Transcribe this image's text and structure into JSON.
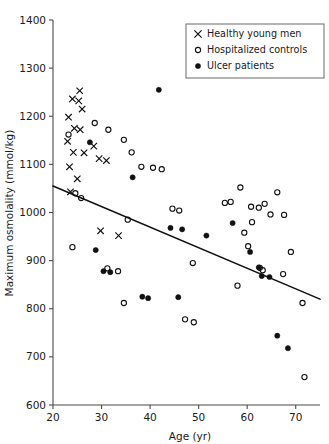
{
  "chart_data": {
    "type": "scatter",
    "title": "",
    "xlabel": "Age (yr)",
    "ylabel": "Maximum osmolality (mmol/kg)",
    "xlim": [
      20,
      75
    ],
    "ylim": [
      600,
      1400
    ],
    "xticks": [
      20,
      30,
      40,
      50,
      60,
      70
    ],
    "yticks": [
      600,
      700,
      800,
      900,
      1000,
      1100,
      1200,
      1300,
      1400
    ],
    "grid": false,
    "legend_position": "top-right",
    "series": [
      {
        "name": "Healthy young men",
        "marker": "cross",
        "points": [
          [
            25.5,
            1253
          ],
          [
            24.0,
            1236
          ],
          [
            25.3,
            1232
          ],
          [
            26.0,
            1215
          ],
          [
            23.2,
            1198
          ],
          [
            24.4,
            1175
          ],
          [
            25.6,
            1172
          ],
          [
            23.0,
            1148
          ],
          [
            24.2,
            1125
          ],
          [
            26.4,
            1124
          ],
          [
            23.4,
            1095
          ],
          [
            25.0,
            1070
          ],
          [
            23.6,
            1043
          ],
          [
            28.4,
            1138
          ],
          [
            29.5,
            1112
          ],
          [
            31.0,
            1108
          ],
          [
            29.8,
            962
          ],
          [
            33.5,
            952
          ]
        ]
      },
      {
        "name": "Hospitalized controls",
        "marker": "circle",
        "points": [
          [
            23.2,
            1162
          ],
          [
            24.6,
            1040
          ],
          [
            25.8,
            1030
          ],
          [
            24.0,
            928
          ],
          [
            28.6,
            1186
          ],
          [
            31.4,
            1172
          ],
          [
            34.6,
            1151
          ],
          [
            36.2,
            1125
          ],
          [
            35.4,
            985
          ],
          [
            33.4,
            878
          ],
          [
            31.2,
            884
          ],
          [
            34.6,
            812
          ],
          [
            38.2,
            1095
          ],
          [
            40.6,
            1093
          ],
          [
            42.4,
            1090
          ],
          [
            44.6,
            1008
          ],
          [
            46.0,
            1004
          ],
          [
            48.8,
            895
          ],
          [
            47.2,
            778
          ],
          [
            49.0,
            772
          ],
          [
            55.4,
            1020
          ],
          [
            56.6,
            1022
          ],
          [
            58.6,
            1052
          ],
          [
            60.8,
            1012
          ],
          [
            62.4,
            1010
          ],
          [
            61.0,
            980
          ],
          [
            59.4,
            958
          ],
          [
            63.6,
            1018
          ],
          [
            64.8,
            996
          ],
          [
            60.2,
            930
          ],
          [
            62.6,
            885
          ],
          [
            63.2,
            880
          ],
          [
            58.0,
            848
          ],
          [
            66.2,
            1042
          ],
          [
            67.6,
            995
          ],
          [
            69.0,
            918
          ],
          [
            67.4,
            872
          ],
          [
            71.4,
            812
          ],
          [
            71.8,
            658
          ]
        ]
      },
      {
        "name": "Ulcer patients",
        "marker": "dot",
        "points": [
          [
            41.8,
            1255
          ],
          [
            27.6,
            1146
          ],
          [
            36.4,
            1073
          ],
          [
            28.8,
            922
          ],
          [
            30.4,
            878
          ],
          [
            31.8,
            876
          ],
          [
            44.2,
            968
          ],
          [
            46.6,
            965
          ],
          [
            51.6,
            952
          ],
          [
            38.4,
            825
          ],
          [
            39.6,
            822
          ],
          [
            45.8,
            824
          ],
          [
            57.0,
            978
          ],
          [
            60.6,
            918
          ],
          [
            62.4,
            886
          ],
          [
            63.0,
            868
          ],
          [
            64.6,
            866
          ],
          [
            66.2,
            744
          ],
          [
            68.4,
            718
          ]
        ]
      }
    ],
    "regression_line": {
      "x_start": 20,
      "y_start": 1055,
      "x_end": 75,
      "y_end": 820
    }
  },
  "legend": {
    "entries": [
      {
        "label": "Healthy young men",
        "marker": "cross"
      },
      {
        "label": "Hospitalized controls",
        "marker": "circle"
      },
      {
        "label": "Ulcer patients",
        "marker": "dot"
      }
    ]
  }
}
